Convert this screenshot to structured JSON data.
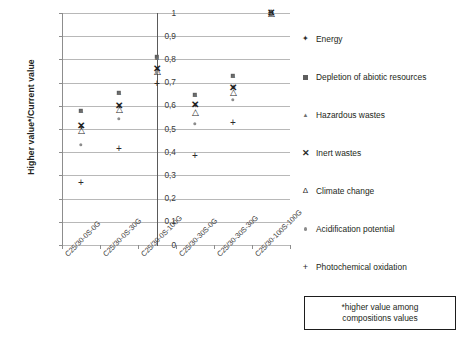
{
  "chart_data": {
    "type": "scatter",
    "title": "",
    "xlabel": "",
    "ylabel": "Higher value*/Current value",
    "ylim": [
      0,
      1
    ],
    "ytick_labels": [
      "1",
      "0,9",
      "0,8",
      "0,7",
      "0,6",
      "0,5",
      "0,4",
      "0,3",
      "0,2",
      "0,1",
      "0"
    ],
    "ytick_values": [
      1,
      0.9,
      0.8,
      0.7,
      0.6,
      0.5,
      0.4,
      0.3,
      0.2,
      0.1,
      0
    ],
    "grid": true,
    "legend_position": "right",
    "categories": [
      "C25/30-0S-0G",
      "C25/30-0S-30G",
      "C25/30-0S-100G",
      "C25/30-30S-0G",
      "C25/30-30S-30G",
      "C25/30-100S-100G"
    ],
    "series": [
      {
        "name": "Energy",
        "marker": "star",
        "values": [
          0.505,
          0.595,
          0.755,
          0.6,
          0.675,
          1.0
        ]
      },
      {
        "name": "Depletion of abiotic resources",
        "marker": "square",
        "values": [
          0.578,
          0.657,
          0.81,
          0.648,
          0.73,
          1.0
        ]
      },
      {
        "name": "Hazardous wastes",
        "marker": "triangle-small",
        "values": [
          0.58,
          0.66,
          0.812,
          0.65,
          0.733,
          1.0
        ]
      },
      {
        "name": "Inert wastes",
        "marker": "x",
        "values": [
          0.512,
          0.598,
          0.757,
          0.602,
          0.678,
          1.0
        ]
      },
      {
        "name": "Climate change",
        "marker": "triangle",
        "values": [
          0.495,
          0.585,
          0.748,
          0.572,
          0.66,
          1.0
        ]
      },
      {
        "name": "Acidification potential",
        "marker": "circle",
        "values": [
          0.432,
          0.545,
          0.745,
          0.522,
          0.625,
          1.0
        ]
      },
      {
        "name": "Photochemical oxidation",
        "marker": "plus",
        "values": [
          0.268,
          0.412,
          0.695,
          0.385,
          0.525,
          1.0
        ]
      }
    ],
    "divider_after_category_index": 2,
    "annotations": [
      "*higher value  among",
      "compositions values"
    ]
  },
  "legend": {
    "items": [
      {
        "label": "Energy",
        "glyph": "✦",
        "kind": "star"
      },
      {
        "label": "Depletion of abiotic resources",
        "glyph": "",
        "kind": "square"
      },
      {
        "label": "Hazardous wastes",
        "glyph": "▲",
        "kind": "tri-small"
      },
      {
        "label": "Inert wastes",
        "glyph": "✕",
        "kind": "ex"
      },
      {
        "label": "Climate change",
        "glyph": "Δ",
        "kind": "tri"
      },
      {
        "label": "Acidification potential",
        "glyph": "",
        "kind": "circle"
      },
      {
        "label": "Photochemical oxidation",
        "glyph": "+",
        "kind": "plus"
      }
    ]
  },
  "note": {
    "line1": "*higher value  among",
    "line2": "compositions values"
  },
  "colors": {
    "gridline": "#b8b8b8",
    "axis": "#8d8d8d",
    "divider": "#5a5a5a",
    "marker_dark": "#1d1d1d",
    "marker_mid": "#5e5e5e",
    "marker_light": "#8c8c8c",
    "text": "#231f20"
  }
}
